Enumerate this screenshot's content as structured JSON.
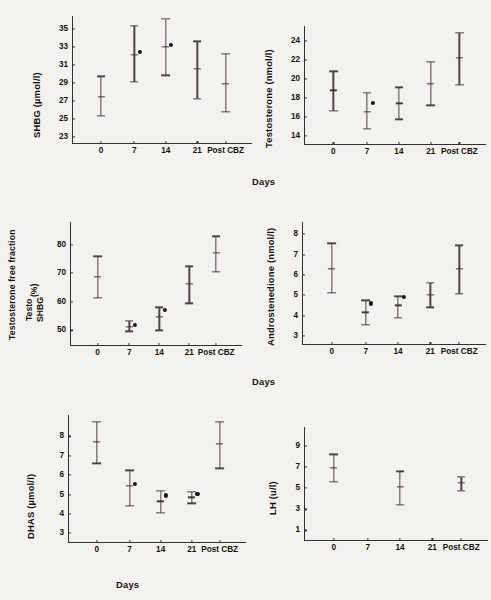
{
  "figure": {
    "background": "#f4f2ee",
    "ink": "#15130f",
    "x_axis_title": "Days",
    "x_categories": [
      "0",
      "7",
      "14",
      "21",
      "Post CBZ"
    ]
  },
  "chart_data": [
    {
      "id": "shbg",
      "type": "scatter",
      "title": "",
      "ylabel": "SHBG (µmol/l)",
      "ylabel_plain": "SHBG",
      "ylabel_unit": "(µmol/l)",
      "xlabel": "Days",
      "categories": [
        "0",
        "7",
        "14",
        "21",
        "Post CBZ"
      ],
      "yticks": [
        23,
        25,
        27,
        29,
        31,
        33,
        35
      ],
      "ylim": [
        22.2,
        36.4
      ],
      "grid": false,
      "legend": "none",
      "series": [
        {
          "name": "mean ± SD",
          "values": [
            27.4,
            32.1,
            33.0,
            30.5,
            28.9
          ],
          "err_low": [
            25.3,
            29.1,
            29.8,
            27.2,
            25.8
          ],
          "err_high": [
            29.7,
            35.3,
            36.1,
            33.6,
            32.2
          ]
        },
        {
          "name": "individual point",
          "values": [
            null,
            32.4,
            33.2,
            null,
            null
          ]
        }
      ]
    },
    {
      "id": "testosterone",
      "type": "scatter",
      "title": "",
      "ylabel": "Testosterone (nmol/l)",
      "ylabel_plain": "Testosterone",
      "ylabel_unit": "(nmol/l)",
      "xlabel": "Days",
      "categories": [
        "0",
        "7",
        "14",
        "21",
        "Post CBZ"
      ],
      "yticks": [
        14,
        16,
        18,
        20,
        22,
        24
      ],
      "ylim": [
        13.0,
        25.6
      ],
      "grid": false,
      "legend": "none",
      "series": [
        {
          "name": "mean ± SD",
          "values": [
            18.8,
            16.5,
            17.4,
            19.5,
            22.2
          ],
          "err_low": [
            16.6,
            14.7,
            15.7,
            17.2,
            19.4
          ],
          "err_high": [
            20.8,
            18.5,
            19.1,
            21.8,
            24.9
          ]
        },
        {
          "name": "individual point",
          "values": [
            null,
            17.5,
            null,
            null,
            null
          ]
        }
      ]
    },
    {
      "id": "testosterone-free-fraction",
      "type": "scatter",
      "title": "",
      "ylabel": "Testosterone free fraction Testo/SHBG (%)",
      "ylabel_line1": "Testosterone free fraction",
      "ylabel_numerator": "Testo",
      "ylabel_denominator": "SHBG",
      "ylabel_unit": "(%)",
      "xlabel": "Days",
      "categories": [
        "0",
        "7",
        "14",
        "21",
        "Post CBZ"
      ],
      "yticks": [
        50,
        60,
        70,
        80
      ],
      "ylim": [
        44.5,
        88.0
      ],
      "grid": false,
      "legend": "none",
      "series": [
        {
          "name": "mean ± SD",
          "values": [
            68.8,
            51.3,
            54.8,
            66.2,
            77.1
          ],
          "err_low": [
            61.4,
            49.6,
            50.0,
            59.5,
            70.5
          ],
          "err_high": [
            76.0,
            53.2,
            58.1,
            72.4,
            83.0
          ]
        },
        {
          "name": "individual point",
          "values": [
            null,
            51.8,
            57.1,
            null,
            null
          ]
        }
      ]
    },
    {
      "id": "androstenedione",
      "type": "scatter",
      "title": "",
      "ylabel": "Androstenedione (nmol/l)",
      "ylabel_plain": "Androstenedione",
      "ylabel_unit": "(nmol/l)",
      "xlabel": "Days",
      "categories": [
        "0",
        "7",
        "14",
        "21",
        "Post CBZ"
      ],
      "yticks": [
        3,
        4,
        5,
        6,
        7,
        8
      ],
      "ylim": [
        2.55,
        8.6
      ],
      "grid": false,
      "legend": "none",
      "series": [
        {
          "name": "mean ± SD",
          "values": [
            6.3,
            4.15,
            4.5,
            5.0,
            6.3
          ],
          "err_low": [
            5.1,
            3.55,
            3.9,
            4.4,
            5.05
          ],
          "err_high": [
            7.55,
            4.75,
            4.95,
            5.6,
            7.45
          ]
        },
        {
          "name": "individual point",
          "values": [
            null,
            4.6,
            4.9,
            null,
            null
          ]
        }
      ]
    },
    {
      "id": "dhas",
      "type": "scatter",
      "title": "",
      "ylabel": "DHAS (µmol/l)",
      "ylabel_plain": "DHAS",
      "ylabel_unit": "(µmol/l)",
      "xlabel": "Days",
      "categories": [
        "0",
        "7",
        "14",
        "21",
        "Post CBZ"
      ],
      "yticks": [
        3,
        4,
        5,
        6,
        7,
        8
      ],
      "ylim": [
        2.5,
        9.1
      ],
      "grid": false,
      "legend": "none",
      "series": [
        {
          "name": "mean ± SD",
          "values": [
            7.7,
            5.45,
            4.65,
            4.85,
            7.6
          ],
          "err_low": [
            6.6,
            4.4,
            4.05,
            4.55,
            6.35
          ],
          "err_high": [
            8.75,
            6.25,
            5.2,
            5.15,
            8.75
          ]
        },
        {
          "name": "individual point",
          "values": [
            null,
            5.55,
            4.95,
            5.05,
            null
          ]
        }
      ]
    },
    {
      "id": "lh",
      "type": "scatter",
      "title": "",
      "ylabel": "LH (u/l)",
      "ylabel_plain": "LH",
      "ylabel_unit": "(u/l)",
      "xlabel": "Days",
      "categories": [
        "0",
        "7",
        "14",
        "21",
        "Post CBZ"
      ],
      "yticks": [
        1,
        3,
        5,
        7,
        9
      ],
      "ylim": [
        0.0,
        10.8
      ],
      "grid": false,
      "legend": "none",
      "series": [
        {
          "name": "mean ± SD",
          "values": [
            6.9,
            null,
            5.1,
            null,
            5.5
          ],
          "err_low": [
            5.6,
            null,
            3.45,
            null,
            4.75
          ],
          "err_high": [
            8.2,
            null,
            6.6,
            null,
            6.1
          ]
        },
        {
          "name": "individual point",
          "values": [
            null,
            null,
            null,
            null,
            null
          ]
        }
      ]
    }
  ]
}
